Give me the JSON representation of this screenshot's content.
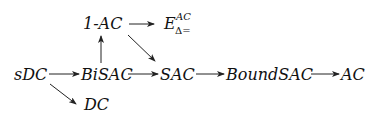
{
  "diagram": {
    "nodes": [
      {
        "id": "one-ac",
        "label_prefix": "1-",
        "label": "AC",
        "x": 83,
        "y": 16
      },
      {
        "id": "e-delta",
        "label": "E",
        "sup": "AC",
        "sub": "Δ=",
        "x": 164,
        "y": 16
      },
      {
        "id": "sdc",
        "label": "sDC",
        "x": 14,
        "y": 67
      },
      {
        "id": "bisac",
        "label": "BiSAC",
        "x": 80,
        "y": 67
      },
      {
        "id": "sac",
        "label": "SAC",
        "x": 160,
        "y": 67
      },
      {
        "id": "boundsac",
        "label": "BoundSAC",
        "x": 225,
        "y": 67
      },
      {
        "id": "ac",
        "label": "AC",
        "x": 340,
        "y": 67
      },
      {
        "id": "dc",
        "label": "DC",
        "x": 85,
        "y": 96
      }
    ],
    "edges": [
      {
        "from": "one-ac",
        "to": "e-delta"
      },
      {
        "from": "bisac",
        "to": "one-ac"
      },
      {
        "from": "one-ac",
        "to": "sac"
      },
      {
        "from": "sdc",
        "to": "bisac"
      },
      {
        "from": "bisac",
        "to": "sac"
      },
      {
        "from": "sac",
        "to": "boundsac"
      },
      {
        "from": "boundsac",
        "to": "ac"
      },
      {
        "from": "sdc",
        "to": "dc"
      }
    ],
    "colors": {
      "line": "#222222",
      "text": "#111111",
      "background": "#ffffff"
    }
  }
}
